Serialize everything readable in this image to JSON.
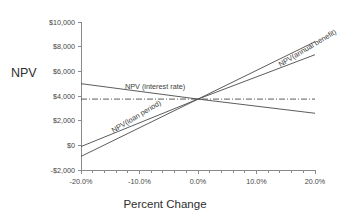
{
  "chart_data": {
    "type": "line",
    "title": "",
    "subtitle": "",
    "xlabel": "Percent Change",
    "ylabel": "NPV",
    "xlim": [
      -20,
      20
    ],
    "ylim": [
      -2000,
      10000
    ],
    "grid": false,
    "legend_position": "inline-labels",
    "x_tick_labels": [
      "-20.0%",
      "-10.0%",
      "0.0%",
      "10.0%",
      "20.0%"
    ],
    "x_tick_values": [
      -20,
      -10,
      0,
      10,
      20
    ],
    "x_minor_tick_step": 2,
    "y_tick_labels": [
      "$10,000",
      "$8,000",
      "$6,000",
      "$4,000",
      "$2,000",
      "$0",
      "-$2,000"
    ],
    "y_tick_values": [
      10000,
      8000,
      6000,
      4000,
      2000,
      0,
      -2000
    ],
    "x": [
      -20,
      0,
      20
    ],
    "series": [
      {
        "name": "NPV(annual benefit)",
        "label": "NPV(annual benefit)",
        "style": "solid",
        "values": [
          -900,
          3750,
          8400
        ]
      },
      {
        "name": "NPV(loan period)",
        "label": "NPV(loan period)",
        "style": "solid",
        "values": [
          -100,
          3750,
          7350
        ]
      },
      {
        "name": "NPV (interest rate)",
        "label": "NPV (interest rate)",
        "style": "solid",
        "values": [
          5000,
          3750,
          2600
        ]
      },
      {
        "name": "NPV baseline",
        "label": "",
        "style": "dash-dot",
        "values": [
          3750,
          3750,
          3750
        ]
      }
    ],
    "annotations": [
      {
        "text": "NPV(annual benefit)",
        "x": 13.5,
        "y": 6800,
        "rotation": -31
      },
      {
        "text": "NPV (interest rate)",
        "x": -12.5,
        "y": 5100,
        "rotation": 0
      },
      {
        "text": "NPV(loan period)",
        "x": -15.0,
        "y": 1450,
        "rotation": -31
      }
    ],
    "colors": {
      "line": "#4a4a4a",
      "axis": "#8a8a8a",
      "text": "#3a3a3a",
      "background": "#ffffff"
    }
  }
}
